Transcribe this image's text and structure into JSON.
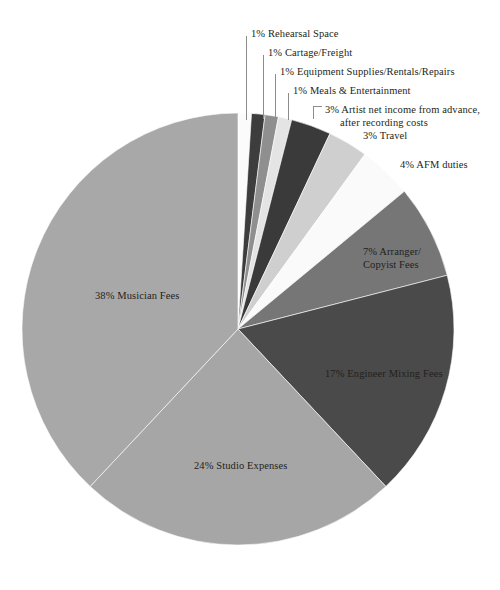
{
  "chart_data": {
    "type": "pie",
    "title": "",
    "subtitle": "",
    "xlabel": "",
    "ylabel": "",
    "legend_position": "none",
    "grid": false,
    "units": "percent",
    "total": 100,
    "start_angle_deg": 0,
    "direction": "clockwise",
    "categories": [
      "Rehearsal Space",
      "Cartage/Freight",
      "Equipment Supplies/Rentals/Repairs",
      "Meals & Entertainment",
      "Artist net income from advance, after recording costs",
      "Travel",
      "AFM duties",
      "Arranger/Copyist Fees",
      "Engineer Mixing Fees",
      "Studio Expenses",
      "Musician Fees"
    ],
    "values": [
      1,
      1,
      1,
      1,
      3,
      3,
      4,
      7,
      17,
      24,
      38
    ],
    "colors": [
      "#fbfbfb",
      "#3d3d3d",
      "#8f8f8f",
      "#e4e4e4",
      "#3a3a3a",
      "#cfcfcf",
      "#fafafa",
      "#767676",
      "#4a4a4a",
      "#a6a6a6",
      "#a8a8a8"
    ],
    "slices": [
      {
        "label": "1% Rehearsal Space",
        "percent": 1,
        "name": "Rehearsal Space",
        "color": "#fbfbfb",
        "label_style": "callout"
      },
      {
        "label": "1% Cartage/Freight",
        "percent": 1,
        "name": "Cartage/Freight",
        "color": "#3d3d3d",
        "label_style": "callout"
      },
      {
        "label": "1% Equipment Supplies/Rentals/Repairs",
        "percent": 1,
        "name": "Equipment Supplies/Rentals/Repairs",
        "color": "#8f8f8f",
        "label_style": "callout"
      },
      {
        "label": "1% Meals & Entertainment",
        "percent": 1,
        "name": "Meals & Entertainment",
        "color": "#e4e4e4",
        "label_style": "callout"
      },
      {
        "label": "3% Artist net income from advance,",
        "label_line2": "after recording costs",
        "percent": 3,
        "name": "Artist net income from advance, after recording costs",
        "color": "#3a3a3a",
        "label_style": "callout"
      },
      {
        "label": "3% Travel",
        "percent": 3,
        "name": "Travel",
        "color": "#cfcfcf",
        "label_style": "outside"
      },
      {
        "label": "4% AFM duties",
        "percent": 4,
        "name": "AFM duties",
        "color": "#fafafa",
        "label_style": "outside"
      },
      {
        "label": "7% Arranger/",
        "label_line2": "Copyist Fees",
        "percent": 7,
        "name": "Arranger/Copyist Fees",
        "color": "#767676",
        "label_style": "inside"
      },
      {
        "label": "17% Engineer Mixing Fees",
        "percent": 17,
        "name": "Engineer Mixing Fees",
        "color": "#4a4a4a",
        "label_style": "inside"
      },
      {
        "label": "24% Studio Expenses",
        "percent": 24,
        "name": "Studio Expenses",
        "color": "#a6a6a6",
        "label_style": "inside"
      },
      {
        "label": "38% Musician Fees",
        "percent": 38,
        "name": "Musician Fees",
        "color": "#a8a8a8",
        "label_style": "inside"
      }
    ]
  },
  "labels": {
    "rehearsal_space": "1% Rehearsal Space",
    "cartage_freight": "1% Cartage/Freight",
    "equipment_supplies": "1% Equipment Supplies/Rentals/Repairs",
    "meals_entertainment": "1% Meals & Entertainment",
    "artist_net_income_l1": "3% Artist net income from advance,",
    "artist_net_income_l2": "after recording costs",
    "travel": "3% Travel",
    "afm_duties": "4% AFM duties",
    "arranger_l1": "7% Arranger/",
    "arranger_l2": "Copyist Fees",
    "engineer_mixing": "17% Engineer Mixing Fees",
    "studio_expenses": "24% Studio Expenses",
    "musician_fees": "38% Musician Fees"
  },
  "geometry": {
    "center_x": 238,
    "center_y": 329,
    "radius": 216
  }
}
